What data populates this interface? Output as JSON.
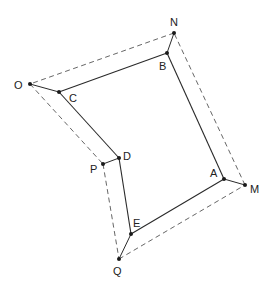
{
  "diagram": {
    "type": "geometry-polygon-offset",
    "inner_polygon": {
      "style": "solid",
      "color": "#2a2a2a",
      "vertices": [
        {
          "name": "B",
          "x": 167,
          "y": 53
        },
        {
          "name": "C",
          "x": 59,
          "y": 92
        },
        {
          "name": "D",
          "x": 119,
          "y": 158
        },
        {
          "name": "E",
          "x": 131,
          "y": 234
        },
        {
          "name": "A",
          "x": 224,
          "y": 179
        }
      ]
    },
    "outer_polygon": {
      "style": "dashed",
      "color": "#555555",
      "vertices": [
        {
          "name": "N",
          "x": 174,
          "y": 33
        },
        {
          "name": "O",
          "x": 30,
          "y": 84
        },
        {
          "name": "P",
          "x": 103,
          "y": 164
        },
        {
          "name": "Q",
          "x": 119,
          "y": 259
        },
        {
          "name": "M",
          "x": 245,
          "y": 185
        }
      ]
    },
    "connectors": [
      {
        "from": "N",
        "to": "B"
      },
      {
        "from": "O",
        "to": "C"
      },
      {
        "from": "P",
        "to": "D"
      },
      {
        "from": "Q",
        "to": "E"
      },
      {
        "from": "M",
        "to": "A"
      }
    ],
    "labels": {
      "N": "N",
      "B": "B",
      "O": "O",
      "C": "C",
      "D": "D",
      "P": "P",
      "E": "E",
      "Q": "Q",
      "A": "A",
      "M": "M"
    }
  }
}
